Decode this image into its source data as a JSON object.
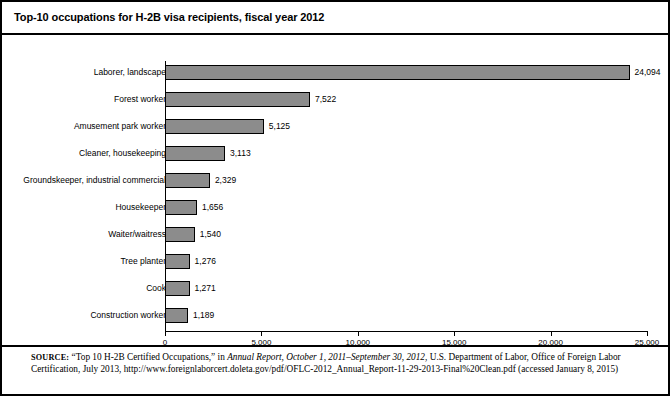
{
  "chart_data": {
    "type": "bar",
    "orientation": "horizontal",
    "title": "Top-10 occupations for H-2B visa recipients, fiscal year 2012",
    "xlabel": "",
    "ylabel": "",
    "xlim": [
      0,
      25000
    ],
    "xticks": [
      0,
      5000,
      10000,
      15000,
      20000,
      25000
    ],
    "xtick_labels": [
      "0",
      "5,000",
      "10,000",
      "15,000",
      "20,000",
      "25,000"
    ],
    "grid": false,
    "legend": false,
    "bar_color": "#8c8c8c",
    "bar_edge_color": "#000000",
    "categories": [
      "Laborer, landscape",
      "Forest worker",
      "Amusement park worker",
      "Cleaner, housekeeping",
      "Groundskeeper, industrial commercial",
      "Housekeeper",
      "Waiter/waitress",
      "Tree planter",
      "Cook",
      "Construction worker"
    ],
    "values": [
      24094,
      7522,
      5125,
      3113,
      2329,
      1656,
      1540,
      1276,
      1271,
      1189
    ],
    "value_labels": [
      "24,094",
      "7,522",
      "5,125",
      "3,113",
      "2,329",
      "1,656",
      "1,540",
      "1,276",
      "1,271",
      "1,189"
    ]
  },
  "source": {
    "label": "SOURCE:",
    "part1": "“Top 10 H-2B Certified Occupations,” in ",
    "italic1": "Annual Report, October 1, 2011–September 30, 2012",
    "part2": ", U.S. Department of Labor, Office of Foreign Labor Certification, July 2013, http://www.foreignlaborcert.doleta.gov/pdf/OFLC-2012_Annual_Report-11-29-2013-Final%20Clean.pdf (accessed January 8, 2015)"
  }
}
